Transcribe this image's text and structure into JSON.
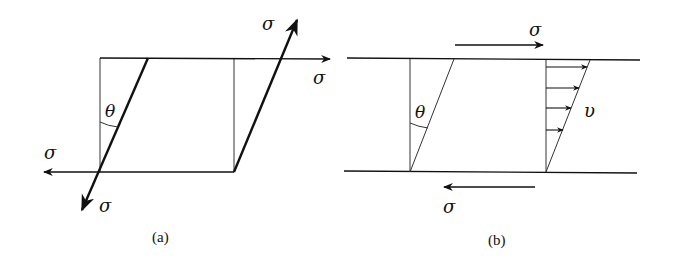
{
  "panels": [
    {
      "id": "a",
      "caption": "(a)",
      "labels": {
        "sigma_top_diag": "σ",
        "sigma_right": "σ",
        "sigma_left": "σ",
        "sigma_bottom_diag": "σ",
        "theta": "θ"
      }
    },
    {
      "id": "b",
      "caption": "(b)",
      "labels": {
        "sigma_top": "σ",
        "sigma_bottom": "σ",
        "theta": "θ",
        "velocity": "υ"
      }
    }
  ],
  "colors": {
    "stroke": "#111111",
    "background": "#ffffff"
  }
}
